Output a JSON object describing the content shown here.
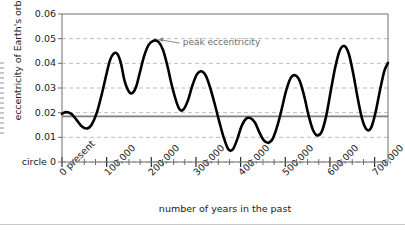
{
  "chart_data": {
    "type": "line",
    "title": "",
    "xlabel": "number of years in the past",
    "ylabel": "eccentricity of Earth's orbit",
    "xlim": [
      0,
      730000
    ],
    "ylim": [
      0,
      0.06
    ],
    "grid": true,
    "legend_position": "none",
    "x_tick_labels": [
      "0  present",
      "100,000",
      "200,000",
      "300,000",
      "400,000",
      "500,000",
      "600,000",
      "700,000"
    ],
    "x_tick_values": [
      0,
      100000,
      200000,
      300000,
      400000,
      500000,
      600000,
      700000
    ],
    "x_minor_tick_step": 25000,
    "y_tick_labels": [
      "circle 0",
      "0.01",
      "0.02",
      "0.03",
      "0.04",
      "0.05",
      "0.06"
    ],
    "y_tick_values": [
      0,
      0.01,
      0.02,
      0.03,
      0.04,
      0.05,
      0.06
    ],
    "zero_label": "circle 0",
    "reference_line": {
      "label": "",
      "value": 0.0185,
      "color": "#808080"
    },
    "annotations": [
      {
        "text": "peak eccentricity",
        "x": 205000,
        "y": 0.0492,
        "label_x": 268000,
        "label_y": 0.0482
      }
    ],
    "series": [
      {
        "name": "eccentricity",
        "color": "#000000",
        "x": [
          0,
          8000,
          20000,
          32000,
          44000,
          56000,
          66000,
          78000,
          90000,
          100000,
          108000,
          116000,
          124000,
          132000,
          140000,
          150000,
          158000,
          166000,
          174000,
          184000,
          194000,
          205000,
          216000,
          226000,
          236000,
          246000,
          256000,
          264000,
          272000,
          282000,
          292000,
          302000,
          312000,
          322000,
          332000,
          342000,
          352000,
          362000,
          372000,
          382000,
          392000,
          402000,
          412000,
          422000,
          432000,
          442000,
          452000,
          462000,
          472000,
          482000,
          492000,
          502000,
          512000,
          522000,
          532000,
          542000,
          552000,
          562000,
          572000,
          582000,
          592000,
          602000,
          612000,
          622000,
          632000,
          642000,
          652000,
          662000,
          672000,
          682000,
          692000,
          702000,
          712000,
          722000,
          730000
        ],
        "y": [
          0.0195,
          0.0202,
          0.0196,
          0.0172,
          0.0145,
          0.0136,
          0.015,
          0.02,
          0.0282,
          0.036,
          0.0415,
          0.044,
          0.0438,
          0.04,
          0.033,
          0.0285,
          0.028,
          0.0305,
          0.036,
          0.043,
          0.0475,
          0.0492,
          0.0487,
          0.0455,
          0.039,
          0.031,
          0.0245,
          0.0212,
          0.0213,
          0.025,
          0.031,
          0.0355,
          0.0368,
          0.035,
          0.03,
          0.0235,
          0.0165,
          0.01,
          0.0053,
          0.005,
          0.009,
          0.0145,
          0.0175,
          0.0178,
          0.016,
          0.012,
          0.0088,
          0.0078,
          0.0095,
          0.0145,
          0.0215,
          0.029,
          0.034,
          0.0352,
          0.033,
          0.027,
          0.019,
          0.013,
          0.0108,
          0.0125,
          0.019,
          0.029,
          0.0385,
          0.0452,
          0.047,
          0.044,
          0.036,
          0.026,
          0.0175,
          0.0132,
          0.0138,
          0.02,
          0.029,
          0.037,
          0.0402
        ]
      }
    ]
  },
  "annotation_label": "peak eccentricity"
}
